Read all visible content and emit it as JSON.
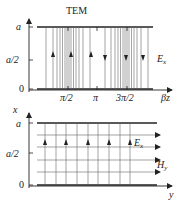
{
  "top_diagram": {
    "title": "TEM",
    "y_ticks": [
      "a",
      "a/2",
      "0"
    ],
    "x_ticks": [
      "π/2",
      "π",
      "3π/2"
    ],
    "x_axis_label": "βz",
    "field_label": "E",
    "field_subscript": "x",
    "arrows_up_at": [
      "~π/4",
      "π/2",
      "~3π/4"
    ],
    "arrows_down_at": [
      "~5π/4",
      "3π/2",
      "~7π/4"
    ]
  },
  "bottom_diagram": {
    "y_axis_label": "x",
    "y_ticks": [
      "a",
      "a/2",
      "0"
    ],
    "x_axis_label": "y",
    "e_label": "E",
    "e_subscript": "x",
    "h_label": "H",
    "h_subscript": "y"
  },
  "colors": {
    "ink": "#222222",
    "line": "#555555",
    "background": "#ffffff"
  }
}
